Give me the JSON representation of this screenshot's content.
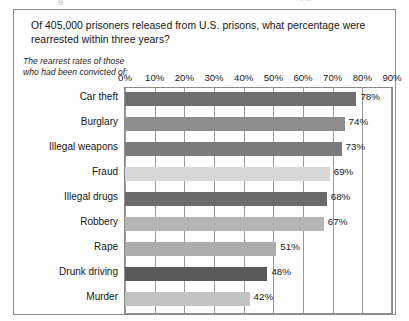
{
  "top_sliver": {
    "left_fragment": "g",
    "right_fragment": "· ··"
  },
  "figure": {
    "question_title": "Of 405,000 prisoners released from U.S. prisons, what percentage were rearrested within three years?",
    "caption": "The rearrest rates of those who had been convicted of:"
  },
  "chart_data": {
    "type": "bar",
    "orientation": "horizontal",
    "title": "Of 405,000 prisoners released from U.S. prisons, what percentage were rearrested within three years?",
    "subtitle": "The rearrest rates of those who had been convicted of:",
    "xlabel": "",
    "ylabel": "",
    "xlim": [
      0,
      90
    ],
    "grid": true,
    "legend": "none",
    "axis_position": "top",
    "tick_labels": [
      "0%",
      "10%",
      "20%",
      "30%",
      "40%",
      "50%",
      "60%",
      "70%",
      "80%",
      "90%"
    ],
    "ticks": [
      0,
      10,
      20,
      30,
      40,
      50,
      60,
      70,
      80,
      90
    ],
    "categories": [
      "Car theft",
      "Burglary",
      "Illegal weapons",
      "Fraud",
      "Illegal drugs",
      "Robbery",
      "Rape",
      "Drunk driving",
      "Murder"
    ],
    "values": [
      78,
      74,
      73,
      69,
      68,
      67,
      51,
      48,
      42
    ],
    "value_labels": [
      "78%",
      "74%",
      "73%",
      "69%",
      "68%",
      "67%",
      "51%",
      "48%",
      "42%"
    ],
    "bar_colors": [
      "#6f6f6f",
      "#8d8d8d",
      "#7b7b7b",
      "#d8d8d8",
      "#6b6b6b",
      "#b4b4b4",
      "#adadad",
      "#5a5a5a",
      "#c3c3c3"
    ],
    "bars": [
      {
        "category": "Car theft",
        "value": 78,
        "label": "78%",
        "color": "#6f6f6f"
      },
      {
        "category": "Burglary",
        "value": 74,
        "label": "74%",
        "color": "#8d8d8d"
      },
      {
        "category": "Illegal weapons",
        "value": 73,
        "label": "73%",
        "color": "#7b7b7b"
      },
      {
        "category": "Fraud",
        "value": 69,
        "label": "69%",
        "color": "#d8d8d8"
      },
      {
        "category": "Illegal drugs",
        "value": 68,
        "label": "68%",
        "color": "#6b6b6b"
      },
      {
        "category": "Robbery",
        "value": 67,
        "label": "67%",
        "color": "#b4b4b4"
      },
      {
        "category": "Rape",
        "value": 51,
        "label": "51%",
        "color": "#adadad"
      },
      {
        "category": "Drunk driving",
        "value": 48,
        "label": "48%",
        "color": "#5a5a5a"
      },
      {
        "category": "Murder",
        "value": 42,
        "label": "42%",
        "color": "#c3c3c3"
      }
    ]
  },
  "colors": {
    "frame": "#8e8e8e",
    "gridline": "#9a9a9a",
    "text": "#161616",
    "background": "#ffffff"
  }
}
